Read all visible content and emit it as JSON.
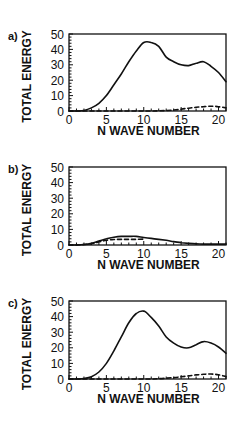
{
  "chart_data": [
    {
      "type": "line",
      "panel_label": "a)",
      "xlabel": "N WAVE NUMBER",
      "ylabel": "TOTAL ENERGY",
      "xlim": [
        0,
        21
      ],
      "ylim": [
        0,
        50
      ],
      "xticks": [
        0,
        5,
        10,
        15,
        20
      ],
      "yticks": [
        0,
        10,
        20,
        30,
        40,
        50
      ],
      "grid": false,
      "legend": null,
      "x": [
        0,
        1,
        2,
        3,
        4,
        5,
        6,
        7,
        8,
        9,
        10,
        11,
        12,
        13,
        14,
        15,
        16,
        17,
        18,
        19,
        20,
        21
      ],
      "series": [
        {
          "name": "solid",
          "style": "solid",
          "values": [
            0,
            0,
            0.3,
            2,
            5,
            10,
            17,
            24,
            32,
            39,
            44.5,
            44.5,
            42,
            35,
            32,
            30,
            29.5,
            31,
            32,
            29,
            25,
            19
          ]
        },
        {
          "name": "dashed",
          "style": "dashed",
          "values": [
            0,
            0,
            0,
            0,
            0,
            0,
            0,
            0,
            0,
            0,
            0,
            0,
            0.1,
            0.3,
            0.6,
            1.2,
            1.8,
            2.4,
            2.8,
            3.1,
            2.8,
            2.0
          ]
        }
      ]
    },
    {
      "type": "line",
      "panel_label": "b)",
      "xlabel": "N WAVE NUMBER",
      "ylabel": "TOTAL ENERGY",
      "xlim": [
        0,
        21
      ],
      "ylim": [
        0,
        50
      ],
      "xticks": [
        0,
        5,
        10,
        15,
        20
      ],
      "yticks": [
        0,
        10,
        20,
        30,
        40,
        50
      ],
      "grid": false,
      "legend": null,
      "x": [
        0,
        1,
        2,
        3,
        4,
        5,
        6,
        7,
        8,
        9,
        10,
        11,
        12,
        13,
        14,
        15,
        16,
        17,
        18,
        19,
        20,
        21
      ],
      "series": [
        {
          "name": "solid",
          "style": "solid",
          "values": [
            0,
            0,
            0.3,
            1,
            2.5,
            4,
            5,
            5.5,
            5.5,
            5.5,
            4.8,
            4.2,
            3.6,
            3,
            2.2,
            1.5,
            1,
            0.7,
            0.6,
            0.6,
            0.6,
            0.6
          ]
        },
        {
          "name": "dashed",
          "style": "dashed",
          "values": [
            0,
            0,
            0.3,
            0.8,
            2,
            3,
            3.5,
            3.6,
            3.6,
            3.6,
            3.8,
            null,
            null,
            null,
            null,
            null,
            null,
            null,
            null,
            null,
            null,
            null
          ]
        }
      ]
    },
    {
      "type": "line",
      "panel_label": "c)",
      "xlabel": "N WAVE NUMBER",
      "ylabel": "TOTAL ENERGY",
      "xlim": [
        0,
        21
      ],
      "ylim": [
        0,
        50
      ],
      "xticks": [
        0,
        5,
        10,
        15,
        20
      ],
      "yticks": [
        0,
        10,
        20,
        30,
        40,
        50
      ],
      "grid": false,
      "legend": null,
      "x": [
        0,
        1,
        2,
        3,
        4,
        5,
        6,
        7,
        8,
        9,
        10,
        11,
        12,
        13,
        14,
        15,
        16,
        17,
        18,
        19,
        20,
        21
      ],
      "series": [
        {
          "name": "solid",
          "style": "solid",
          "values": [
            0,
            0,
            0.3,
            1.5,
            4.5,
            10,
            18,
            27,
            36,
            42,
            43.5,
            39.5,
            34,
            27,
            23,
            20.5,
            20,
            22,
            24,
            23,
            20.5,
            16.5
          ]
        },
        {
          "name": "dashed",
          "style": "dashed",
          "values": [
            0,
            0,
            0,
            0,
            0,
            0,
            0,
            0,
            0,
            0,
            0,
            0,
            0.2,
            0.5,
            0.9,
            1.4,
            2,
            2.6,
            3,
            3.2,
            2.7,
            1.6
          ]
        }
      ]
    }
  ]
}
